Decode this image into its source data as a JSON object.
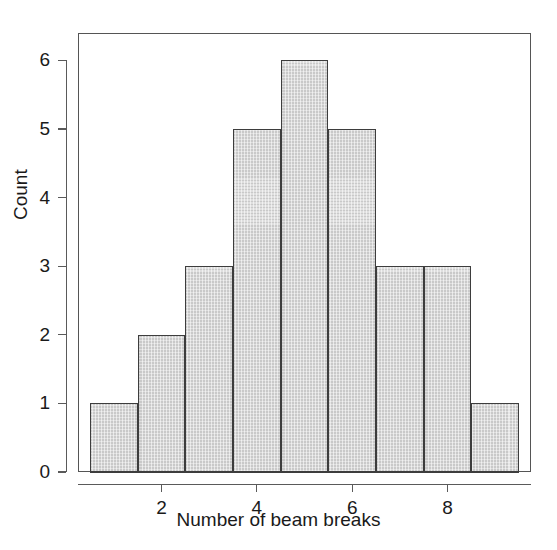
{
  "chart_data": {
    "type": "bar",
    "chart_subtype": "histogram",
    "title": "",
    "subtitle": "",
    "xlabel": "Number of beam breaks",
    "ylabel": "Count",
    "categories": [
      "1",
      "2",
      "3",
      "4",
      "5",
      "6",
      "7",
      "8",
      "9"
    ],
    "values": [
      1,
      2,
      3,
      5,
      6,
      5,
      3,
      3,
      1
    ],
    "bin_edges": [
      0.5,
      1.5,
      2.5,
      3.5,
      4.5,
      5.5,
      6.5,
      7.5,
      8.5,
      9.5
    ],
    "bin_width": 1,
    "total_count": 29,
    "xlim": [
      0.25,
      9.75
    ],
    "ylim": [
      0,
      6.4
    ],
    "x_ticks": [
      2,
      4,
      6,
      8
    ],
    "x_tick_labels": [
      "2",
      "4",
      "6",
      "8"
    ],
    "y_ticks": [
      0,
      1,
      2,
      3,
      4,
      5,
      6
    ],
    "y_tick_labels": [
      "0",
      "1",
      "2",
      "3",
      "4",
      "5",
      "6"
    ],
    "grid": false,
    "legend": false,
    "legend_position": "none",
    "annotations": [],
    "colors": {
      "bar_fill": "#c9c9c9",
      "bar_edge": "#3d3d3d",
      "axis": "#5a5a5a",
      "frame": "#555555",
      "text": "#1a1a1a",
      "background": "#ffffff"
    }
  }
}
